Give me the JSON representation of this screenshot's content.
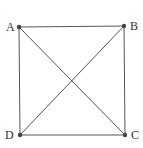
{
  "diagram": {
    "type": "square-with-diagonals",
    "stroke_color": "#555555",
    "point_color": "#444444",
    "vertices": [
      {
        "label": "A",
        "x": 19,
        "y": 27
      },
      {
        "label": "B",
        "x": 124,
        "y": 26
      },
      {
        "label": "C",
        "x": 125,
        "y": 135
      },
      {
        "label": "D",
        "x": 20,
        "y": 135
      }
    ],
    "edges": [
      [
        "A",
        "B"
      ],
      [
        "B",
        "C"
      ],
      [
        "C",
        "D"
      ],
      [
        "D",
        "A"
      ],
      [
        "A",
        "C"
      ],
      [
        "B",
        "D"
      ]
    ],
    "labels": {
      "A": "A",
      "B": "B",
      "C": "C",
      "D": "D"
    }
  }
}
